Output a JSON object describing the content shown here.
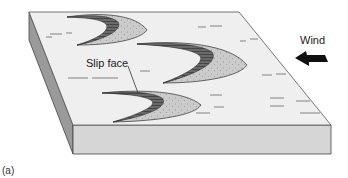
{
  "figure": {
    "panel_label": "(a)",
    "wind_label": "Wind",
    "slip_face_label": "Slip face",
    "colors": {
      "top_face": "#efefef",
      "front_face": "#d6d6d6",
      "side_face": "#9a9a9a",
      "outline": "#444444",
      "slip_face": "#5a5a5a",
      "windward_slope": "#c9c9c9",
      "arrow": "#111111"
    },
    "dunes": [
      {
        "name": "barchan-dune-1"
      },
      {
        "name": "barchan-dune-2"
      },
      {
        "name": "barchan-dune-3"
      }
    ]
  }
}
